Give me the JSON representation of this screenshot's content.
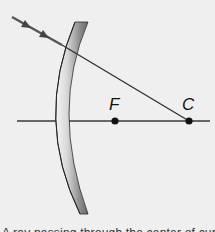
{
  "diagram": {
    "type": "concave-mirror-ray-diagram",
    "colors": {
      "background": "#efefef",
      "axis": "#3a3a3a",
      "ray": "#2e2e2e",
      "incident_ray": "#555555",
      "mirror_light": "#f2f2f2",
      "mirror_dark": "#6e6e6e",
      "point": "#111111"
    },
    "points": [
      {
        "id": "focal-point",
        "label": "F"
      },
      {
        "id": "center-of-curvature",
        "label": "C"
      }
    ],
    "ray": {
      "description": "Incident ray passing through center of curvature C",
      "arrowheads": 2
    },
    "caption": "A ray passing through the center of curvature"
  }
}
